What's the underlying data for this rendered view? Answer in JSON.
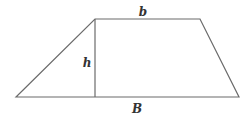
{
  "diagram": {
    "stroke_color": "#6b6b6b",
    "stroke_width": 1.2,
    "vertices": {
      "bottom_left": [
        16,
        97
      ],
      "top_left": [
        95,
        19
      ],
      "top_right": [
        200,
        19
      ],
      "bottom_right": [
        239,
        97
      ]
    },
    "height_line": {
      "x": 95,
      "y1": 19,
      "y2": 97
    },
    "labels": {
      "top_base": {
        "text": "b",
        "x": 143,
        "y": 12
      },
      "height": {
        "text": "h",
        "x": 87,
        "y": 63
      },
      "bottom_base": {
        "text": "B",
        "x": 137,
        "y": 109
      }
    }
  }
}
